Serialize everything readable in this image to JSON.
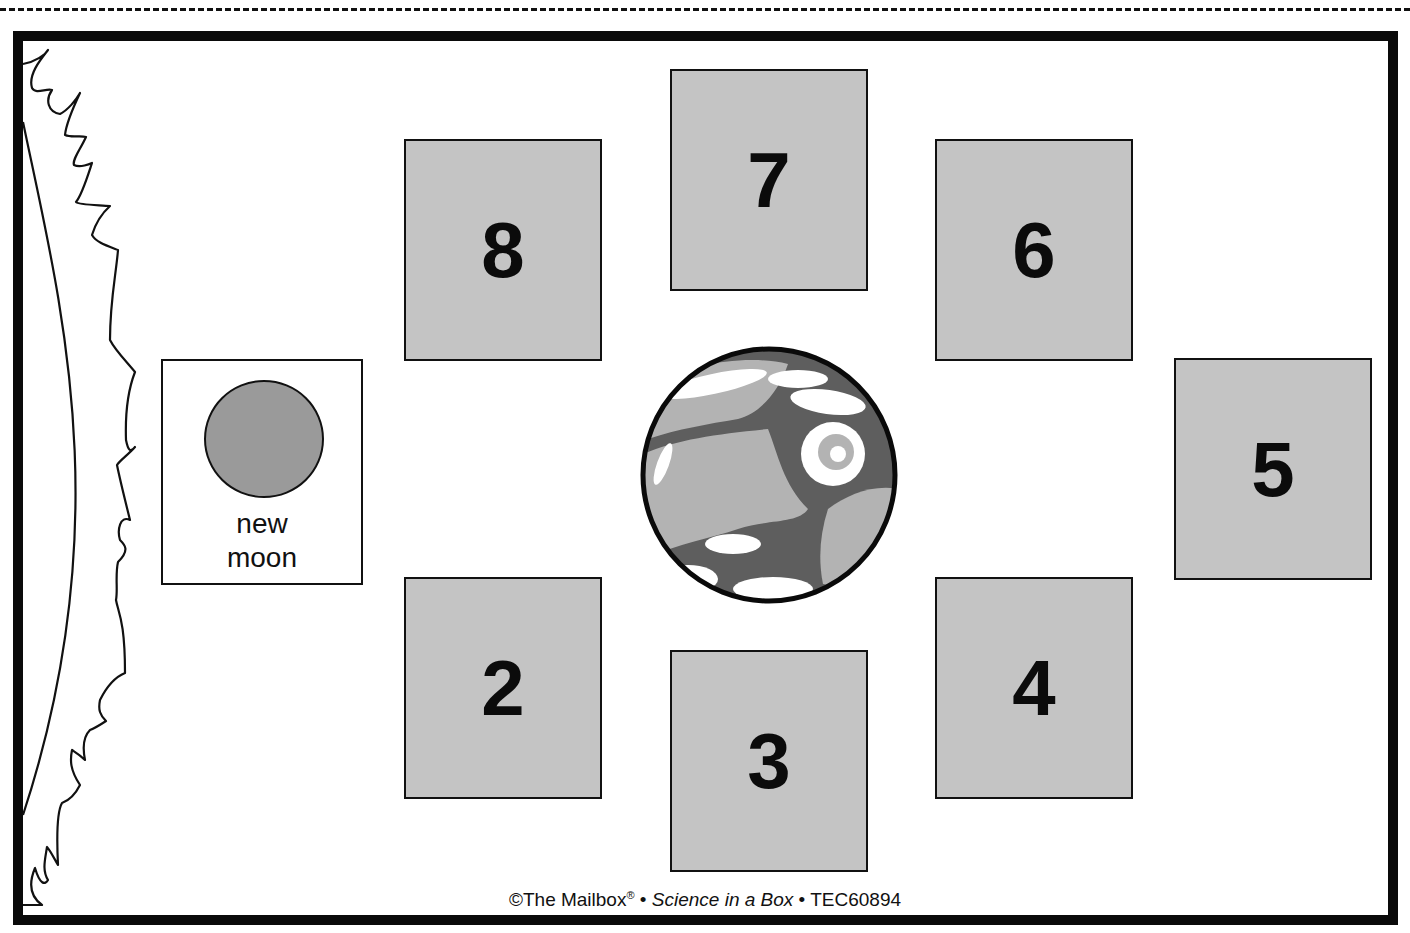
{
  "cut_line": {
    "style": "dashed"
  },
  "sun": {
    "label": "sun-edge"
  },
  "new_moon": {
    "line1": "new",
    "line2": "moon",
    "disc_color": "#9a9a9a"
  },
  "earth": {
    "label": "Earth"
  },
  "phase_boxes": [
    {
      "number": "8",
      "left": 404,
      "top": 139
    },
    {
      "number": "7",
      "left": 670,
      "top": 69
    },
    {
      "number": "6",
      "left": 935,
      "top": 139
    },
    {
      "number": "5",
      "left": 1174,
      "top": 358
    },
    {
      "number": "4",
      "left": 935,
      "top": 577
    },
    {
      "number": "3",
      "left": 670,
      "top": 650
    },
    {
      "number": "2",
      "left": 404,
      "top": 577
    }
  ],
  "colors": {
    "box_fill": "#c4c4c4",
    "frame": "#0a0a0a",
    "earth_land": "#b3b3b3",
    "earth_ocean": "#5e5e5e"
  },
  "footer": {
    "copyright": "©The Mailbox",
    "registered": "®",
    "separator": " • ",
    "title": "Science in a Box",
    "code": "TEC60894"
  }
}
